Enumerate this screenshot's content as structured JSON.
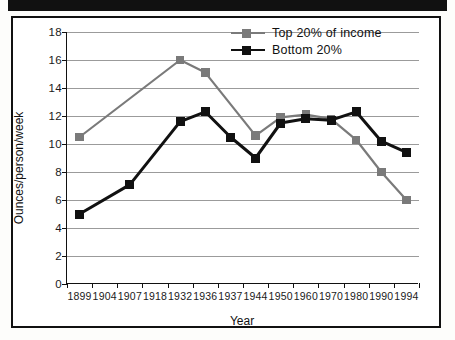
{
  "figure": {
    "scan_bar": "black-scan-artifact"
  },
  "chart_data": {
    "type": "line",
    "title": "",
    "xlabel": "Year",
    "ylabel": "Ounces/person/week",
    "categories": [
      "1899",
      "1904",
      "1907",
      "1918",
      "1932",
      "1936",
      "1937",
      "1944",
      "1950",
      "1960",
      "1970",
      "1980",
      "1990",
      "1994"
    ],
    "ylim": [
      0,
      18
    ],
    "yticks": [
      0,
      2,
      4,
      6,
      8,
      10,
      12,
      14,
      16,
      18
    ],
    "grid": true,
    "legend_position": "top-right",
    "series": [
      {
        "name": "Top 20% of income",
        "color": "#7a7a7a",
        "marker": "square",
        "values": [
          10.5,
          null,
          null,
          null,
          16.0,
          15.1,
          null,
          10.6,
          11.9,
          12.1,
          11.8,
          10.3,
          8.0,
          6.0
        ]
      },
      {
        "name": "Bottom 20%",
        "color": "#111111",
        "marker": "square",
        "values": [
          5.0,
          null,
          7.1,
          null,
          11.6,
          12.3,
          10.5,
          9.0,
          11.5,
          11.8,
          11.7,
          12.3,
          10.2,
          9.4
        ]
      }
    ]
  },
  "legend": {
    "items": [
      {
        "label": "Top 20% of income",
        "color": "#7a7a7a"
      },
      {
        "label": "Bottom 20%",
        "color": "#111111"
      }
    ]
  }
}
